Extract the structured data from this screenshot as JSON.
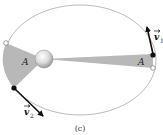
{
  "diagram": {
    "orbit": {
      "cx": 80,
      "cy": 60,
      "rx": 76,
      "ry": 55,
      "stroke": "#aaaaaa"
    },
    "sun": {
      "cx": 44,
      "cy": 59,
      "r": 9
    },
    "regions": [
      {
        "label": "A",
        "side": "left",
        "fill": "#b8b8b8"
      },
      {
        "label": "A",
        "side": "right",
        "fill": "#b8b8b8"
      }
    ],
    "vectors": [
      {
        "name": "v1",
        "symbol": "v",
        "subscript": "1"
      },
      {
        "name": "v2",
        "symbol": "v",
        "subscript": "2"
      }
    ],
    "caption": "(c)"
  }
}
